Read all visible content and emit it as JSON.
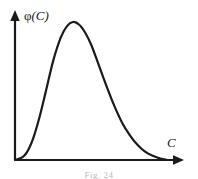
{
  "figure": {
    "caption": "Fig. 24",
    "background_color": "#ffffff",
    "ink_color": "#1a1a1a"
  },
  "axes": {
    "y_label": "φ(C)",
    "y_label_symbol": "φ",
    "y_label_arg": "(C)",
    "x_label": "C",
    "y_arrow": "arrow-up",
    "x_arrow": "arrow-right"
  },
  "chart_data": {
    "type": "line",
    "title": "",
    "xlabel": "C",
    "ylabel": "φ(C)",
    "xlim": [
      0,
      1
    ],
    "ylim": [
      0,
      1
    ],
    "grid": false,
    "legend": null,
    "ticks": {
      "x": [],
      "y": []
    },
    "series": [
      {
        "name": "φ(C)",
        "color": "#1a1a1a",
        "linewidth": 2.2,
        "description": "Unimodal right-skewed distribution curve rising from origin to a peak then decaying asymptotically toward the x-axis",
        "x": [
          0.0,
          0.03,
          0.06,
          0.09,
          0.12,
          0.16,
          0.2,
          0.25,
          0.3,
          0.34,
          0.38,
          0.42,
          0.46,
          0.5,
          0.55,
          0.6,
          0.65,
          0.7,
          0.75,
          0.8,
          0.85,
          0.9,
          0.95,
          1.0
        ],
        "y": [
          0.0,
          0.01,
          0.03,
          0.08,
          0.16,
          0.31,
          0.49,
          0.72,
          0.89,
          0.97,
          1.0,
          0.98,
          0.92,
          0.83,
          0.68,
          0.53,
          0.39,
          0.27,
          0.18,
          0.11,
          0.06,
          0.03,
          0.01,
          0.0
        ]
      }
    ],
    "annotations": [
      {
        "name": "peak",
        "x": 0.38,
        "y": 1.0
      }
    ]
  }
}
